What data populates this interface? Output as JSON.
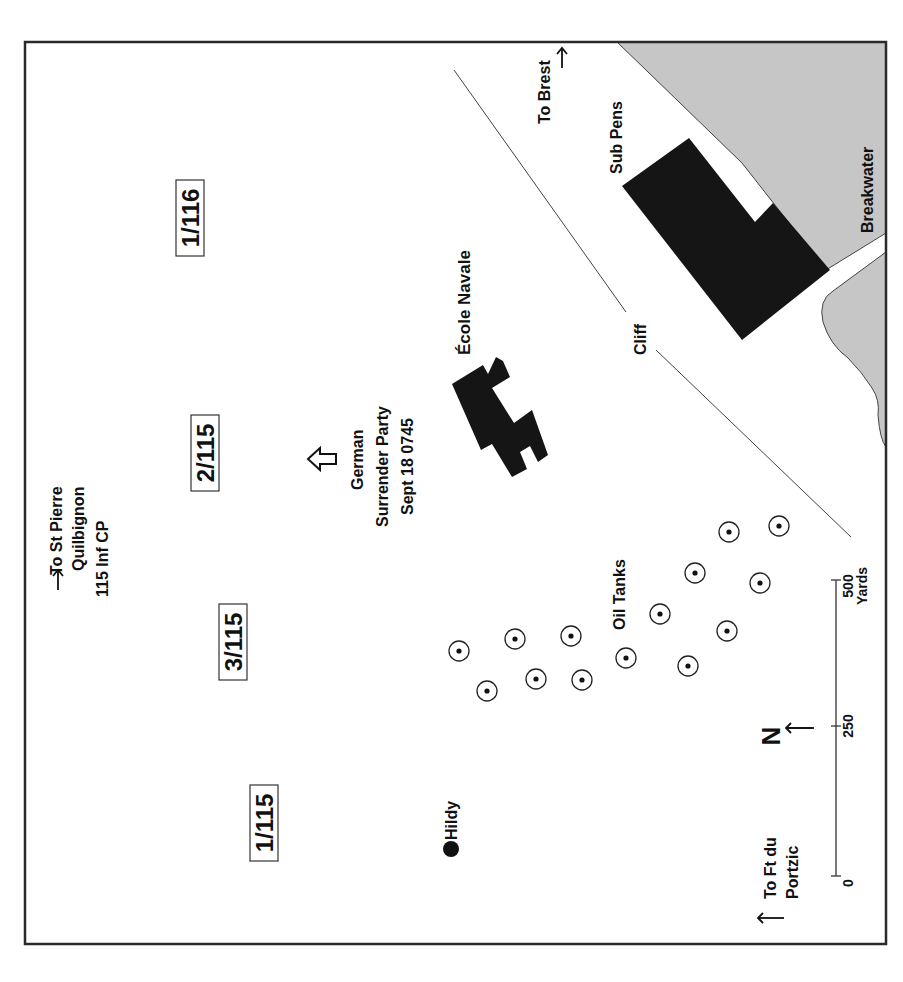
{
  "map": {
    "orientation": "rotated 90° clockwise (north arrow points left)",
    "colors": {
      "border": "#2a2a2a",
      "water": "#c8c8c8",
      "building": "#151515",
      "background": "#ffffff"
    },
    "directions": {
      "st_pierre": {
        "line1": "To St Pierre",
        "line2": "Quilbignon",
        "line3": "115 Inf CP"
      },
      "brest": {
        "line1": "To Brest"
      },
      "portzic": {
        "line1": "To Ft du",
        "line2": "Portzic"
      }
    },
    "units": [
      {
        "label": "1/116"
      },
      {
        "label": "2/115"
      },
      {
        "label": "3/115"
      },
      {
        "label": "1/115"
      }
    ],
    "surrender": {
      "line1": "German",
      "line2": "Surrender  Party",
      "line3": "Sept 18  0745"
    },
    "features": {
      "ecole_navale": "École Navale",
      "sub_pens": "Sub Pens",
      "breakwater": "Breakwater",
      "cliff": "Cliff",
      "oil_tanks": "Oil Tanks",
      "hildy": "Hildy"
    },
    "north": {
      "label": "N"
    },
    "scale": {
      "tick0": "0",
      "tick250": "250",
      "tick500": "500",
      "unit": "Yards"
    },
    "oil_tank_count": 14
  }
}
